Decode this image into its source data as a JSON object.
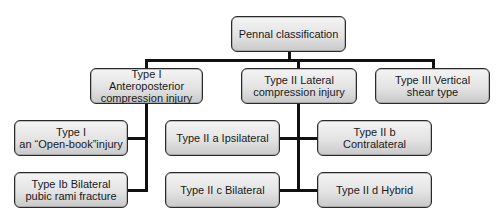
{
  "diagram": {
    "type": "tree",
    "root": {
      "label": "Pennal classification"
    },
    "level1": [
      {
        "label": "Type I\nAnteroposterior\ncompression injury"
      },
      {
        "label": "Type II Lateral\ncompression injury"
      },
      {
        "label": "Type III Vertical\nshear type"
      }
    ],
    "type1_children": [
      {
        "label": "Type I\nan “Open-book”injury"
      },
      {
        "label": "Type Ib Bilateral\npubic rami fracture"
      }
    ],
    "type2_children": [
      {
        "label": "Type II a Ipsilateral"
      },
      {
        "label": "Type II b\nContralateral"
      },
      {
        "label": "Type II c Bilateral"
      },
      {
        "label": "Type II d Hybrid"
      }
    ],
    "colors": {
      "box_top": "#f4f4f4",
      "box_bottom": "#c9c9c9",
      "border": "#2a2a2a",
      "connector": "#111111"
    }
  }
}
